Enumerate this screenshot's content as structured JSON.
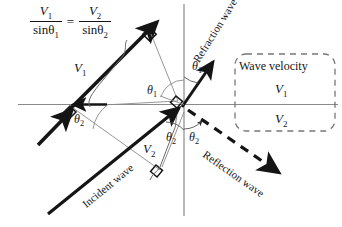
{
  "figure": {
    "width": 342,
    "height": 227,
    "background": "#ffffff",
    "stroke_color": "#151515",
    "thin_line_color": "#808080"
  },
  "equation": {
    "left_numerator": "V",
    "left_numerator_sub": "1",
    "left_denominator": "sinθ",
    "left_denominator_sub": "1",
    "equals": "=",
    "right_numerator": "V",
    "right_numerator_sub": "2",
    "right_denominator": "sinθ",
    "right_denominator_sub": "2"
  },
  "labels": {
    "v1_upper": "V",
    "v1_upper_sub": "1",
    "v2_lower": "V",
    "v2_lower_sub": "2",
    "theta1_left": "θ",
    "theta1_left_sub": "1",
    "theta1_right": "θ",
    "theta1_right_sub": "1",
    "theta2_left": "θ",
    "theta2_left_sub": "2",
    "theta2_center": "θ",
    "theta2_center_sub": "2",
    "theta2_right": "θ",
    "theta2_right_sub": "2"
  },
  "waves": {
    "incident": "Incident wave",
    "refraction": "Refraction wave",
    "reflection": "Reflection wave"
  },
  "velocity_box": {
    "title": "Wave velocity",
    "upper_medium": "V",
    "upper_medium_sub": "1",
    "lower_medium": "V",
    "lower_medium_sub": "2"
  }
}
